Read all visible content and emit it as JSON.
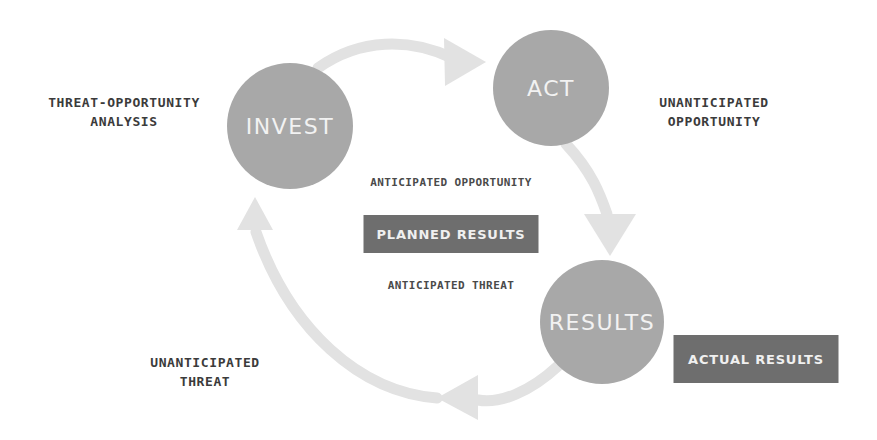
{
  "diagram": {
    "type": "cycle-diagram",
    "background_color": "#ffffff",
    "node_fill_color": "#a8a8a8",
    "node_text_color": "#f2f2f2",
    "arrow_color": "#e2e2e2",
    "box_fill_color": "#6e6e6e",
    "box_text_color": "#f0f0f0",
    "label_text_color": "#3b3b3b"
  },
  "nodes": [
    {
      "id": "invest",
      "label": "INVEST",
      "cx": 290,
      "cy": 126,
      "r": 63,
      "font_size": 22
    },
    {
      "id": "act",
      "label": "ACT",
      "cx": 551,
      "cy": 88,
      "r": 58,
      "font_size": 22
    },
    {
      "id": "results",
      "label": "RESULTS",
      "cx": 602,
      "cy": 322,
      "r": 62,
      "font_size": 22
    }
  ],
  "outer_labels": [
    {
      "id": "threat-opportunity-analysis",
      "text": "THREAT-OPPORTUNITY\nANALYSIS",
      "x": 124,
      "y": 112
    },
    {
      "id": "unanticipated-opportunity",
      "text": "UNANTICIPATED\nOPPORTUNITY",
      "x": 714,
      "y": 112
    },
    {
      "id": "unanticipated-threat",
      "text": "UNANTICIPATED\nTHREAT",
      "x": 205,
      "y": 372
    }
  ],
  "center_labels": [
    {
      "id": "anticipated-opportunity",
      "text": "ANTICIPATED OPPORTUNITY",
      "x": 451,
      "y": 182
    },
    {
      "id": "anticipated-threat",
      "text": "ANTICIPATED THREAT",
      "x": 451,
      "y": 285
    }
  ],
  "result_boxes": [
    {
      "id": "planned-results",
      "text": "PLANNED RESULTS",
      "x": 451,
      "y": 234,
      "w": 175,
      "h": 38
    },
    {
      "id": "actual-results",
      "text": "ACTUAL RESULTS",
      "x": 756,
      "y": 359,
      "w": 165,
      "h": 48
    }
  ],
  "arrows": [
    {
      "id": "invest-to-act",
      "from": "invest",
      "to": "act",
      "direction": "right",
      "path": "M 318 68 C 360 38 410 38 452 58",
      "head_points": "444,38 486,62 445,86"
    },
    {
      "id": "act-to-results",
      "from": "act",
      "to": "results",
      "direction": "down",
      "path": "M 566 144 C 592 172 600 194 607 214",
      "head_points": "584,214 636,214 610,256"
    },
    {
      "id": "results-to-invest",
      "from": "results",
      "to": "invest",
      "direction": "left",
      "path": "M 558 366 C 530 392 500 404 478 400",
      "head_points": "478,375 478,420 437,398"
    },
    {
      "id": "invest-cycle-return",
      "from": "results",
      "to": "invest",
      "direction": "up",
      "path": "M 437 398 C 360 392 290 330 256 232",
      "head_points": "237,230 273,230 255,197"
    }
  ],
  "chart_data": {
    "type": "diagram",
    "nodes": [
      "INVEST",
      "ACT",
      "RESULTS"
    ],
    "edges": [
      {
        "from": "INVEST",
        "to": "ACT"
      },
      {
        "from": "ACT",
        "to": "RESULTS"
      },
      {
        "from": "RESULTS",
        "to": "INVEST"
      }
    ],
    "annotations": [
      "THREAT-OPPORTUNITY ANALYSIS",
      "UNANTICIPATED OPPORTUNITY",
      "ANTICIPATED OPPORTUNITY",
      "PLANNED RESULTS",
      "ANTICIPATED THREAT",
      "ACTUAL RESULTS",
      "UNANTICIPATED THREAT"
    ]
  }
}
